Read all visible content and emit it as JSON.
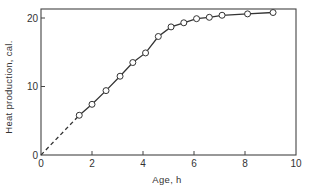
{
  "chart_data": {
    "type": "line",
    "title": "",
    "xlabel": "Age, h",
    "ylabel": "Heat production, cal.",
    "xlim": [
      0,
      10
    ],
    "ylim": [
      0,
      21
    ],
    "x_ticks": [
      0,
      2,
      4,
      6,
      8,
      10
    ],
    "y_ticks": [
      0,
      10,
      20
    ],
    "x_tick_labels": [
      "0",
      "2",
      "4",
      "6",
      "8",
      "10"
    ],
    "y_tick_labels": [
      "0",
      "10",
      "20"
    ],
    "grid": false,
    "legend": null,
    "series": [
      {
        "name": "Heat production",
        "marker": "open-circle",
        "x": [
          1.5,
          2.0,
          2.55,
          3.1,
          3.6,
          4.1,
          4.6,
          5.1,
          5.6,
          6.1,
          6.6,
          7.1,
          8.1,
          9.1
        ],
        "y": [
          5.8,
          7.4,
          9.4,
          11.5,
          13.5,
          14.9,
          17.3,
          18.7,
          19.3,
          19.9,
          20.1,
          20.4,
          20.6,
          20.8
        ]
      }
    ],
    "extrapolation": {
      "style": "dashed",
      "from": [
        0,
        0
      ],
      "to": [
        1.5,
        5.8
      ]
    },
    "colors": {
      "line": "#333333",
      "marker_fill": "#ffffff",
      "axis": "#444444"
    }
  }
}
